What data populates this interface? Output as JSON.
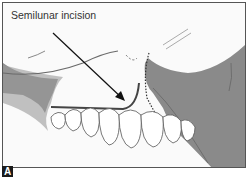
{
  "figure": {
    "annotation_label": "Semilunar incision",
    "panel_letter": "A",
    "colors": {
      "bone_gray": "#8a8a8a",
      "light_gray": "#b8b8b8",
      "outline": "#444444",
      "incision": "#555555",
      "background": "#fafafa"
    }
  }
}
